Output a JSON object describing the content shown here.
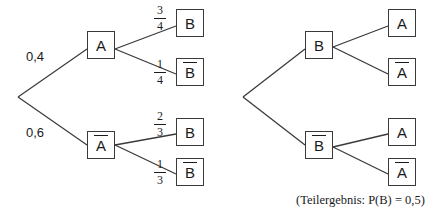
{
  "figure": {
    "caption": "(Teilergebnis: P(B) = 0,5)"
  },
  "left_tree": {
    "root_branches": [
      {
        "label": "0,4",
        "target": "A"
      },
      {
        "label": "0,6",
        "target": "A-bar"
      }
    ],
    "nodes": {
      "level1_top": "A",
      "level1_bottom": "A",
      "leaf_1": "B",
      "leaf_2": "B",
      "leaf_3": "B",
      "leaf_4": "B"
    },
    "fractions": [
      {
        "num": "3",
        "den": "4"
      },
      {
        "num": "1",
        "den": "4"
      },
      {
        "num": "2",
        "den": "3"
      },
      {
        "num": "1",
        "den": "3"
      }
    ]
  },
  "right_tree": {
    "nodes": {
      "level1_top": "B",
      "level1_bottom": "B",
      "leaf_1": "A",
      "leaf_2": "A",
      "leaf_3": "A",
      "leaf_4": "A"
    }
  },
  "colors": {
    "stroke": "#3a3a3a",
    "text": "#1b1b1b",
    "background": "#ffffff"
  }
}
